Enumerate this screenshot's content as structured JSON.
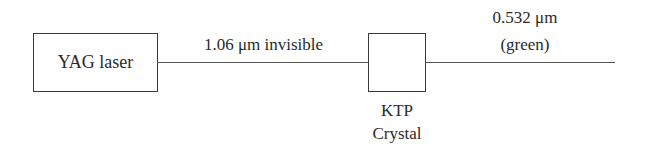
{
  "diagram": {
    "title": "",
    "nodes": [
      {
        "id": "yag",
        "label": "YAG laser"
      },
      {
        "id": "ktp",
        "label": "",
        "caption_lines": [
          "KTP",
          "Crystal"
        ]
      }
    ],
    "edges": [
      {
        "from": "yag",
        "to": "ktp",
        "label": "1.06 μm invisible"
      },
      {
        "from": "ktp",
        "to": "output",
        "label_lines": [
          "0.532 μm",
          "(green)"
        ]
      }
    ]
  },
  "labels": {
    "yag_box": "YAG laser",
    "beam_in": "1.06 μm invisible",
    "beam_out_1": "0.532 μm",
    "beam_out_2": "(green)",
    "ktp_1": "KTP",
    "ktp_2": "Crystal"
  }
}
